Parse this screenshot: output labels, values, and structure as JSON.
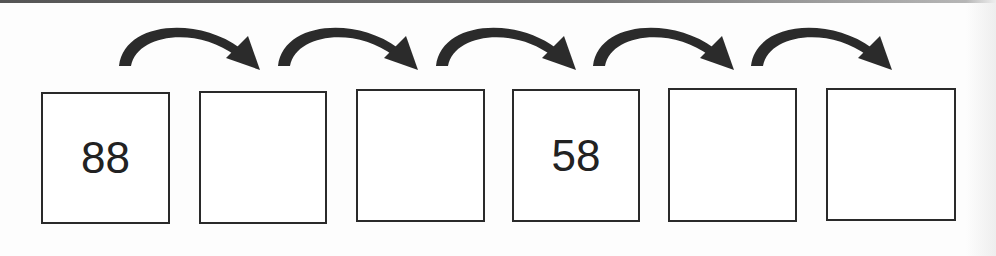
{
  "diagram": {
    "type": "number-sequence",
    "boxes": [
      {
        "value": "88",
        "x": 41,
        "y": 92,
        "w": 129,
        "h": 132
      },
      {
        "value": "",
        "x": 199,
        "y": 91,
        "w": 128,
        "h": 133
      },
      {
        "value": "",
        "x": 356,
        "y": 89,
        "w": 129,
        "h": 133
      },
      {
        "value": "58",
        "x": 512,
        "y": 89,
        "w": 128,
        "h": 133
      },
      {
        "value": "",
        "x": 668,
        "y": 88,
        "w": 129,
        "h": 134
      },
      {
        "value": "",
        "x": 826,
        "y": 88,
        "w": 130,
        "h": 133
      }
    ],
    "arrows": [
      {
        "from": 0,
        "to": 1,
        "x1": 119,
        "x2": 260
      },
      {
        "from": 1,
        "to": 2,
        "x1": 278,
        "x2": 418
      },
      {
        "from": 2,
        "to": 3,
        "x1": 436,
        "x2": 576
      },
      {
        "from": 3,
        "to": 4,
        "x1": 593,
        "x2": 734
      },
      {
        "from": 4,
        "to": 5,
        "x1": 751,
        "x2": 892
      }
    ],
    "colors": {
      "arrow": "#2b2b2b",
      "border": "#2a2a2a",
      "text": "#222222"
    }
  }
}
